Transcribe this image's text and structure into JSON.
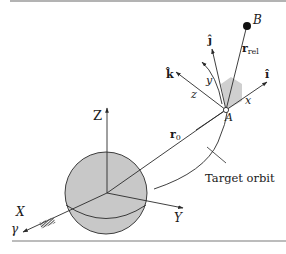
{
  "figure": {
    "width": 286,
    "height": 254,
    "colors": {
      "line": "#2a2a2a",
      "sphere_fill": "#c8c8c8",
      "shade_fill": "#cfcfcf",
      "rule": "#7a7a7a",
      "background": "#ffffff"
    }
  },
  "inertial_frame": {
    "z_label": "Z",
    "y_label": "Y",
    "x_label": "X",
    "vernal_equinox_label": "γ"
  },
  "vectors": {
    "r0_label": "r",
    "r0_subscript": "0",
    "rrel_label": "r",
    "rrel_subscript": "rel"
  },
  "points": {
    "target_label": "A",
    "chaser_label": "B"
  },
  "moving_frame": {
    "i_hat_label": "î",
    "j_hat_label": "ĵ",
    "k_hat_label": "k̂",
    "x_label": "x",
    "y_label": "y",
    "z_label": "z"
  },
  "annotations": {
    "orbit_label": "Target orbit"
  }
}
